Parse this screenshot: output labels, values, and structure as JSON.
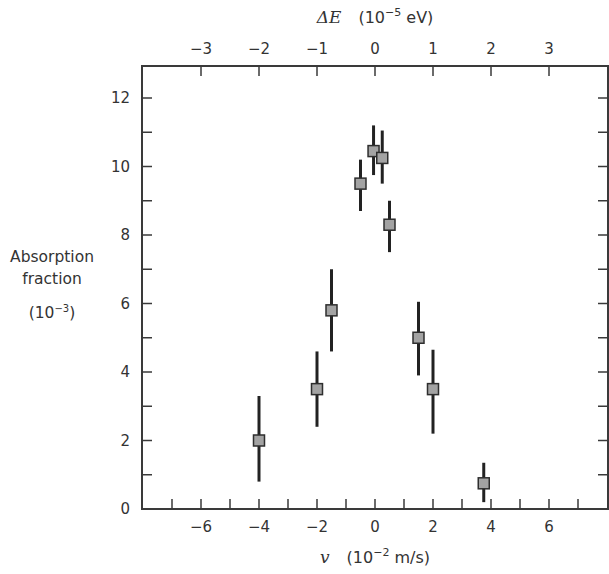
{
  "chart_data": {
    "type": "scatter",
    "title": "",
    "xlabel": "v (10^-2 m/s)",
    "xlabel_var": "v",
    "xlabel_unit_prefix": "(10",
    "xlabel_unit_exp": "−2",
    "xlabel_unit_suffix": " m/s)",
    "x2label": "ΔE (10^-5 eV)",
    "x2label_var": "ΔE",
    "x2label_unit_prefix": "(10",
    "x2label_unit_exp": "−5",
    "x2label_unit_suffix": " eV)",
    "ylabel_lines": [
      "Absorption",
      "fraction"
    ],
    "ylabel_unit_prefix": "(10",
    "ylabel_unit_exp": "−3",
    "ylabel_unit_suffix": ")",
    "xlim": [
      -8,
      8
    ],
    "ylim": [
      0,
      13
    ],
    "x_ticks_major": [
      -6,
      -4,
      -2,
      0,
      2,
      4,
      6
    ],
    "x_tick_labels": [
      "−6",
      "−4",
      "−2",
      "0",
      "2",
      "4",
      "6"
    ],
    "x_ticks_minor": [
      -7,
      -6,
      -5,
      -4,
      -3,
      -2,
      -1,
      0,
      1,
      2,
      3,
      4,
      5,
      6,
      7
    ],
    "x2_ticks": [
      -3,
      -2,
      -1,
      0,
      1,
      2,
      3
    ],
    "x2_tick_labels": [
      "−3",
      "−2",
      "−1",
      "0",
      "1",
      "2",
      "3"
    ],
    "x2_per_x": 0.5,
    "y_ticks_major": [
      0,
      2,
      4,
      6,
      8,
      10,
      12
    ],
    "y_tick_labels": [
      "0",
      "2",
      "4",
      "6",
      "8",
      "10",
      "12"
    ],
    "y_ticks_minor": [
      1,
      2,
      3,
      4,
      5,
      6,
      7,
      8,
      9,
      10,
      11,
      12
    ],
    "grid": false,
    "legend": null,
    "series": [
      {
        "name": "Absorption fraction",
        "marker": "square",
        "marker_fill": "#a3a3a3",
        "marker_edge": "#2e2e2e",
        "errorbar_color": "#222222",
        "points": [
          {
            "x": -4.0,
            "y": 2.0,
            "y_low": 0.8,
            "y_high": 3.3
          },
          {
            "x": -2.0,
            "y": 3.5,
            "y_low": 2.4,
            "y_high": 4.6
          },
          {
            "x": -1.5,
            "y": 5.8,
            "y_low": 4.6,
            "y_high": 7.0
          },
          {
            "x": -0.5,
            "y": 9.5,
            "y_low": 8.7,
            "y_high": 10.2
          },
          {
            "x": -0.05,
            "y": 10.45,
            "y_low": 9.75,
            "y_high": 11.2
          },
          {
            "x": 0.25,
            "y": 10.25,
            "y_low": 9.5,
            "y_high": 11.05
          },
          {
            "x": 0.5,
            "y": 8.3,
            "y_low": 7.5,
            "y_high": 9.0
          },
          {
            "x": 1.5,
            "y": 5.0,
            "y_low": 3.9,
            "y_high": 6.05
          },
          {
            "x": 2.0,
            "y": 3.5,
            "y_low": 2.2,
            "y_high": 4.65
          },
          {
            "x": 3.75,
            "y": 0.75,
            "y_low": 0.2,
            "y_high": 1.35
          }
        ]
      }
    ],
    "colors": {
      "frame": "#3a3a3a",
      "tick": "#3a3a3a",
      "text": "#333333"
    }
  }
}
